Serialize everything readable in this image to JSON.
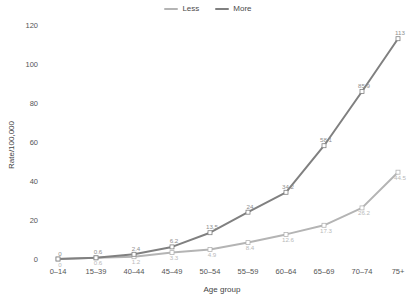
{
  "legend": {
    "position": "top-center",
    "items": [
      {
        "label": "Less",
        "color": "#b4b4b4"
      },
      {
        "label": "More",
        "color": "#808080"
      }
    ]
  },
  "axes": {
    "x_title": "Age group",
    "y_title": "Rate/100,000",
    "y_ticks": [
      "0",
      "20",
      "40",
      "60",
      "80",
      "100",
      "120"
    ],
    "x_ticks": [
      "0–14",
      "15–39",
      "40–44",
      "45–49",
      "50–54",
      "55–59",
      "60–64",
      "65–69",
      "70–74",
      "75+"
    ]
  },
  "chart_data": {
    "type": "line",
    "title": "",
    "subtitle": "",
    "xlabel": "Age group",
    "ylabel": "Rate/100,000",
    "categories": [
      "0–14",
      "15–39",
      "40–44",
      "45–49",
      "50–54",
      "55–59",
      "60–64",
      "65–69",
      "70–74",
      "75+"
    ],
    "series": [
      {
        "name": "Less",
        "color": "#b4b4b4",
        "values": [
          0,
          0.6,
          1.2,
          3.3,
          4.9,
          8.4,
          12.6,
          17.3,
          26.2,
          44.5
        ],
        "labels": [
          "0",
          "0.6",
          "1.2",
          "3.3",
          "4.9",
          "8.4",
          "12.6",
          "17.3",
          "26.2",
          "44.5"
        ]
      },
      {
        "name": "More",
        "color": "#808080",
        "values": [
          0,
          0.6,
          2.4,
          6.2,
          13.5,
          24,
          34.2,
          58.1,
          85.9,
          113
        ],
        "labels": [
          "0",
          "0.6",
          "2.4",
          "6.2",
          "13.5",
          "24",
          "34.2",
          "58.1",
          "85.9",
          "113"
        ]
      }
    ],
    "ylim": [
      0,
      120
    ],
    "ytick_step": 20,
    "grid": false,
    "legend_position": "top-center"
  }
}
